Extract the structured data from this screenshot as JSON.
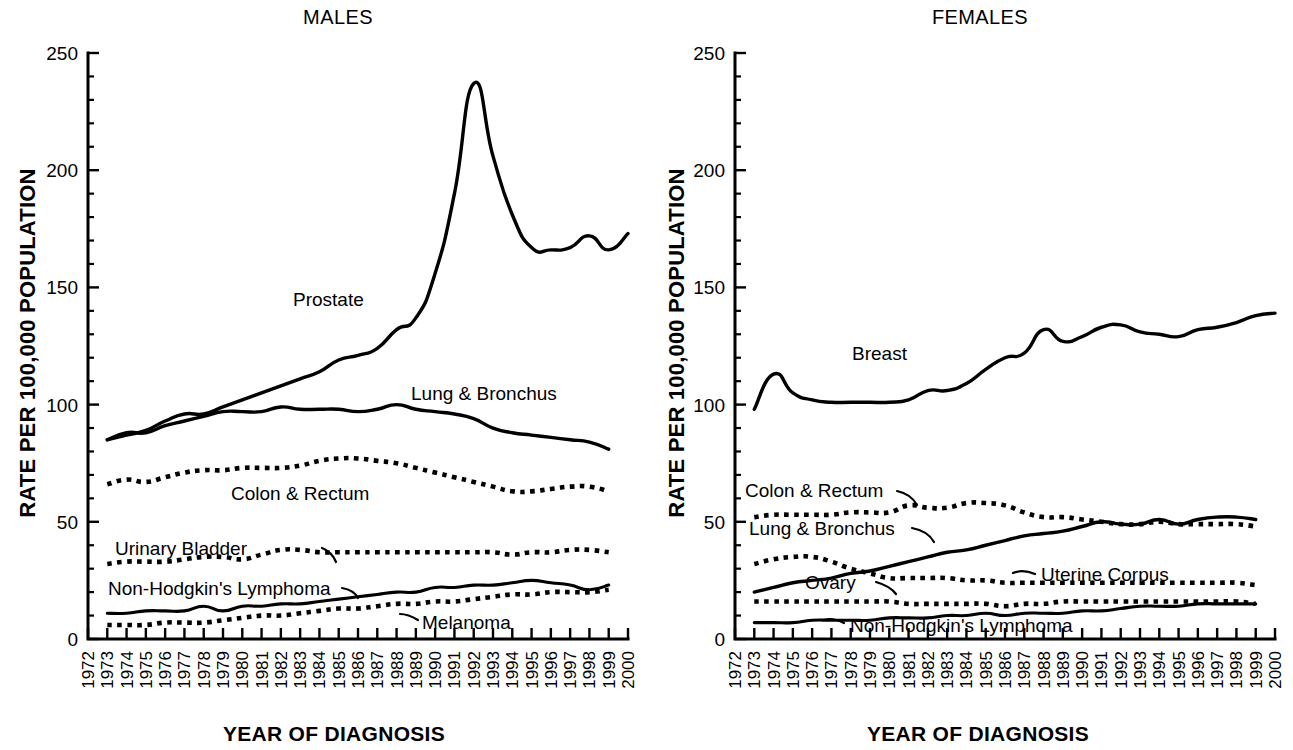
{
  "figure": {
    "y_axis_title": "RATE PER 100,000 POPULATION",
    "x_axis_title": "YEAR OF DIAGNOSIS"
  },
  "panels": {
    "males": {
      "title": "MALES"
    },
    "females": {
      "title": "FEMALES"
    }
  },
  "annotations": {
    "males": {
      "prostate": "Prostate",
      "lung": "Lung & Bronchus",
      "colon": "Colon & Rectum",
      "bladder": "Urinary Bladder",
      "nhl": "Non-Hodgkin's Lymphoma",
      "melanoma": "Melanoma"
    },
    "females": {
      "breast": "Breast",
      "colon": "Colon & Rectum",
      "lung": "Lung & Bronchus",
      "uterine": "Uterine Corpus",
      "ovary": "Ovary",
      "nhl": "Non-Hodgkin's Lymphoma"
    }
  },
  "chart_data": [
    {
      "type": "line",
      "title": "MALES",
      "xlabel": "YEAR OF DIAGNOSIS",
      "ylabel": "RATE PER 100,000 POPULATION",
      "xlim": [
        1972,
        2000
      ],
      "ylim": [
        0,
        250
      ],
      "yticks": [
        0,
        50,
        100,
        150,
        200,
        250
      ],
      "yticks_minor_step": 10,
      "grid": false,
      "legend": "inline-annotations",
      "x": [
        1973,
        1974,
        1975,
        1976,
        1977,
        1978,
        1979,
        1980,
        1981,
        1982,
        1983,
        1984,
        1985,
        1986,
        1987,
        1988,
        1989,
        1990,
        1991,
        1992,
        1993,
        1994,
        1995,
        1996,
        1997,
        1998,
        1999
      ],
      "xtick_labels": [
        "1972",
        "1973",
        "1974",
        "1975",
        "1976",
        "1977",
        "1978",
        "1979",
        "1980",
        "1981",
        "1982",
        "1983",
        "1984",
        "1985",
        "1986",
        "1987",
        "1988",
        "1989",
        "1990",
        "1991",
        "1992",
        "1993",
        "1994",
        "1995",
        "1996",
        "1997",
        "1998",
        "1999",
        "2000"
      ],
      "series": [
        {
          "name": "Prostate",
          "style": "solid",
          "values": [
            85,
            87,
            89,
            93,
            96,
            96,
            99,
            102,
            105,
            108,
            111,
            114,
            119,
            121,
            124,
            132,
            137,
            156,
            190,
            237,
            206,
            181,
            167,
            166,
            167,
            172,
            166,
            173
          ]
        },
        {
          "name": "Lung & Bronchus",
          "style": "solid",
          "values": [
            85,
            88,
            88,
            91,
            93,
            95,
            97,
            97,
            97,
            99,
            98,
            98,
            98,
            97,
            98,
            100,
            98,
            97,
            96,
            94,
            90,
            88,
            87,
            86,
            85,
            84,
            81
          ]
        },
        {
          "name": "Colon & Rectum",
          "style": "dotted",
          "values": [
            66,
            68,
            67,
            69,
            71,
            72,
            72,
            73,
            73,
            73,
            74,
            76,
            77,
            77,
            76,
            75,
            73,
            71,
            69,
            67,
            65,
            63,
            63,
            64,
            65,
            65,
            63
          ]
        },
        {
          "name": "Urinary Bladder",
          "style": "dotted",
          "values": [
            32,
            33,
            33,
            33,
            34,
            35,
            35,
            34,
            36,
            38,
            38,
            37,
            37,
            37,
            37,
            37,
            37,
            37,
            37,
            37,
            37,
            36,
            37,
            37,
            38,
            38,
            37
          ]
        },
        {
          "name": "Non-Hodgkin's Lymphoma",
          "style": "solid-thin",
          "values": [
            11,
            11,
            12,
            12,
            12,
            14,
            12,
            14,
            14,
            15,
            15,
            16,
            17,
            18,
            19,
            20,
            20,
            22,
            22,
            23,
            23,
            24,
            25,
            24,
            23,
            21,
            23
          ]
        },
        {
          "name": "Melanoma",
          "style": "dotted",
          "values": [
            6,
            6,
            6,
            7,
            7,
            7,
            8,
            9,
            10,
            10,
            11,
            12,
            13,
            13,
            14,
            15,
            15,
            16,
            16,
            17,
            18,
            19,
            19,
            20,
            20,
            20,
            21
          ]
        }
      ]
    },
    {
      "type": "line",
      "title": "FEMALES",
      "xlabel": "YEAR OF DIAGNOSIS",
      "ylabel": "RATE PER 100,000 POPULATION",
      "xlim": [
        1972,
        2000
      ],
      "ylim": [
        0,
        250
      ],
      "yticks": [
        0,
        50,
        100,
        150,
        200,
        250
      ],
      "yticks_minor_step": 10,
      "grid": false,
      "legend": "inline-annotations",
      "x": [
        1973,
        1974,
        1975,
        1976,
        1977,
        1978,
        1979,
        1980,
        1981,
        1982,
        1983,
        1984,
        1985,
        1986,
        1987,
        1988,
        1989,
        1990,
        1991,
        1992,
        1993,
        1994,
        1995,
        1996,
        1997,
        1998,
        1999
      ],
      "xtick_labels": [
        "1972",
        "1973",
        "1974",
        "1975",
        "1976",
        "1977",
        "1978",
        "1979",
        "1980",
        "1981",
        "1982",
        "1983",
        "1984",
        "1985",
        "1986",
        "1987",
        "1988",
        "1989",
        "1990",
        "1991",
        "1992",
        "1993",
        "1994",
        "1995",
        "1996",
        "1997",
        "1998",
        "1999",
        "2000"
      ],
      "series": [
        {
          "name": "Breast",
          "style": "solid",
          "values": [
            98,
            113,
            105,
            102,
            101,
            101,
            101,
            101,
            102,
            106,
            106,
            109,
            115,
            120,
            122,
            132,
            127,
            129,
            133,
            134,
            131,
            130,
            129,
            132,
            133,
            135,
            138,
            139
          ]
        },
        {
          "name": "Colon & Rectum",
          "style": "dotted",
          "values": [
            52,
            53,
            53,
            53,
            53,
            54,
            54,
            54,
            57,
            56,
            56,
            58,
            58,
            57,
            54,
            52,
            52,
            51,
            50,
            49,
            49,
            50,
            49,
            49,
            49,
            49,
            48
          ]
        },
        {
          "name": "Lung & Bronchus",
          "style": "solid",
          "values": [
            20,
            22,
            24,
            25,
            26,
            28,
            29,
            31,
            33,
            35,
            37,
            38,
            40,
            42,
            44,
            45,
            46,
            48,
            50,
            49,
            49,
            51,
            49,
            51,
            52,
            52,
            51
          ]
        },
        {
          "name": "Uterine Corpus",
          "style": "dotted",
          "values": [
            32,
            34,
            35,
            35,
            33,
            30,
            28,
            26,
            26,
            26,
            26,
            25,
            25,
            24,
            24,
            24,
            24,
            24,
            24,
            24,
            24,
            24,
            24,
            24,
            24,
            24,
            23
          ]
        },
        {
          "name": "Ovary",
          "style": "dotted",
          "values": [
            16,
            16,
            16,
            16,
            16,
            16,
            16,
            16,
            15,
            15,
            15,
            15,
            15,
            14,
            15,
            15,
            16,
            16,
            16,
            16,
            16,
            16,
            16,
            16,
            16,
            16,
            15
          ]
        },
        {
          "name": "Non-Hodgkin's Lymphoma",
          "style": "solid-thin",
          "values": [
            7,
            7,
            7,
            8,
            8,
            8,
            8,
            9,
            9,
            9,
            10,
            10,
            11,
            10,
            11,
            11,
            11,
            12,
            12,
            13,
            14,
            14,
            14,
            15,
            15,
            15,
            15
          ]
        }
      ]
    }
  ]
}
